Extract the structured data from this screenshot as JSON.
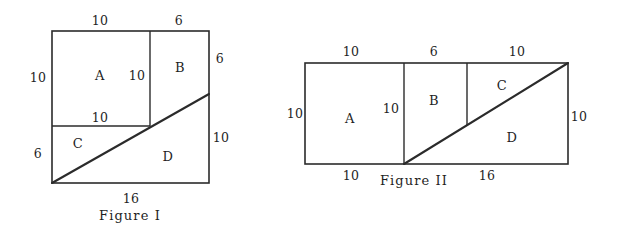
{
  "page": {
    "background_color": "#ffffff",
    "ink_color": "#2b2b2b",
    "width": 617,
    "height": 240
  },
  "figures": [
    {
      "id": "figure-1",
      "caption": "Figure I",
      "caption_x": 130,
      "caption_y": 220,
      "outline": {
        "x": 52,
        "y": 31,
        "width": 157,
        "height": 152
      },
      "dividers": [
        {
          "name": "vertical-divider-ab",
          "x1": 150,
          "y1": 31,
          "x2": 150,
          "y2": 126
        },
        {
          "name": "horizontal-divider-ac",
          "x1": 52,
          "y1": 126,
          "x2": 150,
          "y2": 126
        }
      ],
      "diagonal": {
        "x1": 52,
        "y1": 183,
        "x2": 209,
        "y2": 94
      },
      "regions": [
        {
          "label": "A",
          "x": 100,
          "y": 80
        },
        {
          "label": "B",
          "x": 180,
          "y": 72
        },
        {
          "label": "C",
          "x": 78,
          "y": 148
        },
        {
          "label": "D",
          "x": 168,
          "y": 161
        }
      ],
      "dimensions": [
        {
          "label": "10",
          "x": 100,
          "y": 25,
          "side": "top",
          "name": "fig1-top-left-10"
        },
        {
          "label": "6",
          "x": 179,
          "y": 25,
          "side": "top",
          "name": "fig1-top-right-6"
        },
        {
          "label": "10",
          "x": 38,
          "y": 82,
          "side": "left",
          "name": "fig1-left-10"
        },
        {
          "label": "10",
          "x": 137,
          "y": 80,
          "side": "inner",
          "name": "fig1-inner-vertical-10"
        },
        {
          "label": "6",
          "x": 220,
          "y": 63,
          "side": "right",
          "name": "fig1-right-6"
        },
        {
          "label": "10",
          "x": 100,
          "y": 122,
          "side": "inner",
          "name": "fig1-inner-horizontal-10"
        },
        {
          "label": "6",
          "x": 38,
          "y": 158,
          "side": "left",
          "name": "fig1-left-6"
        },
        {
          "label": "10",
          "x": 221,
          "y": 142,
          "side": "right",
          "name": "fig1-right-10"
        },
        {
          "label": "16",
          "x": 131,
          "y": 203,
          "side": "bottom",
          "name": "fig1-bottom-16"
        }
      ]
    },
    {
      "id": "figure-2",
      "caption": "Figure II",
      "caption_x": 414,
      "caption_y": 185,
      "outline": {
        "x": 305,
        "y": 63,
        "width": 263,
        "height": 101
      },
      "dividers": [
        {
          "name": "vertical-divider-ab",
          "x1": 404,
          "y1": 63,
          "x2": 404,
          "y2": 164
        },
        {
          "name": "vertical-divider-bc",
          "x1": 467,
          "y1": 63,
          "x2": 467,
          "y2": 125
        }
      ],
      "diagonal": {
        "x1": 404,
        "y1": 164,
        "x2": 568,
        "y2": 63
      },
      "regions": [
        {
          "label": "A",
          "x": 350,
          "y": 123
        },
        {
          "label": "B",
          "x": 434,
          "y": 105
        },
        {
          "label": "C",
          "x": 502,
          "y": 90
        },
        {
          "label": "D",
          "x": 512,
          "y": 142
        }
      ],
      "dimensions": [
        {
          "label": "10",
          "x": 351,
          "y": 56,
          "side": "top",
          "name": "fig2-top-10-left"
        },
        {
          "label": "6",
          "x": 434,
          "y": 56,
          "side": "top",
          "name": "fig2-top-6"
        },
        {
          "label": "10",
          "x": 517,
          "y": 56,
          "side": "top",
          "name": "fig2-top-10-right"
        },
        {
          "label": "10",
          "x": 295,
          "y": 118,
          "side": "left",
          "name": "fig2-left-10"
        },
        {
          "label": "10",
          "x": 391,
          "y": 113,
          "side": "inner",
          "name": "fig2-inner-10"
        },
        {
          "label": "10",
          "x": 579,
          "y": 121,
          "side": "right",
          "name": "fig2-right-10"
        },
        {
          "label": "10",
          "x": 351,
          "y": 180,
          "side": "bottom",
          "name": "fig2-bottom-10"
        },
        {
          "label": "16",
          "x": 487,
          "y": 180,
          "side": "bottom",
          "name": "fig2-bottom-16"
        }
      ]
    }
  ]
}
